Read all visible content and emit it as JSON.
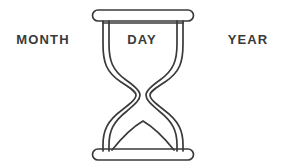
{
  "figure": {
    "background_color": "#ffffff",
    "stroke_color": "#3a3a3a",
    "text_color": "#3a3a3a",
    "width": 284,
    "height": 168
  },
  "labels": {
    "left": "MONTH",
    "center": "DAY",
    "right": "YEAR"
  },
  "illustration": {
    "name": "hourglass",
    "description": "Line-art hourglass with rounded top and bottom caps, double-line glass walls, and a mound of sand in the lower bulb",
    "parts": {
      "top_cap": "top-cap",
      "bottom_cap": "bottom-cap",
      "glass_body": "glass-body",
      "sand_mound": "sand-mound"
    }
  }
}
